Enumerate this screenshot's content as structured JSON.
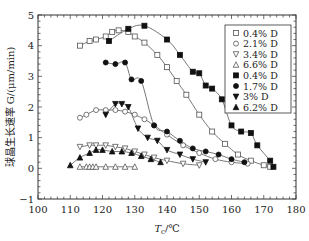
{
  "chart_data": {
    "type": "scatter",
    "title": "",
    "xlabel": "T_c/℃",
    "ylabel": "球晶生长速率 G/(μm/min)",
    "xlim": [
      100,
      180
    ],
    "ylim": [
      -1,
      5
    ],
    "xticks": [
      100,
      110,
      120,
      130,
      140,
      150,
      160,
      170,
      180
    ],
    "yticks": [
      -1,
      0,
      1,
      2,
      3,
      4,
      5
    ],
    "grid": false,
    "legend_position": "upper right",
    "series": [
      {
        "name": "0.4% D",
        "marker": "square-open",
        "x": [
          113,
          116,
          118,
          121,
          123,
          125,
          128,
          130,
          133,
          137,
          140,
          143,
          146,
          150,
          154,
          158,
          162,
          166,
          170,
          172
        ],
        "y": [
          4.0,
          4.15,
          4.2,
          4.3,
          4.45,
          4.5,
          4.45,
          4.3,
          4.1,
          3.7,
          3.3,
          2.85,
          2.4,
          1.75,
          1.2,
          0.8,
          0.45,
          0.25,
          0.1,
          0.05
        ]
      },
      {
        "name": "2.1% D",
        "marker": "circle-open",
        "x": [
          113,
          115,
          118,
          121,
          124,
          127,
          130,
          133,
          136,
          140,
          145,
          150,
          155,
          160,
          165
        ],
        "y": [
          1.65,
          1.75,
          1.9,
          1.9,
          1.9,
          1.85,
          1.75,
          1.6,
          1.4,
          1.1,
          0.75,
          0.5,
          0.3,
          0.2,
          0.15
        ]
      },
      {
        "name": "3.4% D",
        "marker": "triangle-down-open",
        "x": [
          113,
          116,
          118,
          121,
          124,
          127,
          130,
          133,
          136,
          140,
          145,
          150
        ],
        "y": [
          0.7,
          0.75,
          0.75,
          0.75,
          0.7,
          0.65,
          0.55,
          0.45,
          0.35,
          0.25,
          0.15,
          0.1
        ]
      },
      {
        "name": "6.6% D",
        "marker": "triangle-up-open",
        "x": [
          113,
          115,
          116,
          117,
          118,
          121,
          124,
          127,
          130
        ],
        "y": [
          0.05,
          0.05,
          0.05,
          0.05,
          0.05,
          0.05,
          0.05,
          0.05,
          0.05
        ]
      },
      {
        "name": "0.4% D",
        "marker": "square-filled",
        "x": [
          122,
          128,
          133,
          140,
          144,
          148,
          150,
          152,
          154,
          157,
          160,
          163,
          166,
          168,
          172,
          173
        ],
        "y": [
          4.15,
          4.55,
          4.65,
          4.2,
          3.7,
          3.15,
          3.1,
          2.7,
          2.6,
          2.25,
          1.4,
          1.2,
          1.15,
          0.75,
          0.25,
          0.05
        ]
      },
      {
        "name": "1.7% D",
        "marker": "circle-filled",
        "x": [
          121,
          124,
          127,
          129,
          132,
          136,
          140,
          144,
          148,
          152,
          156,
          160,
          164
        ],
        "y": [
          3.45,
          3.4,
          3.45,
          2.9,
          2.85,
          1.4,
          1.2,
          0.9,
          0.65,
          0.55,
          0.45,
          0.3,
          0.2
        ]
      },
      {
        "name": "3% D",
        "marker": "triangle-down-filled",
        "x": [
          121,
          124,
          126,
          128,
          131,
          134,
          137,
          140,
          144,
          148,
          152
        ],
        "y": [
          1.75,
          2.1,
          2.1,
          2.0,
          1.3,
          1.0,
          0.9,
          0.6,
          0.45,
          0.3,
          0.2
        ]
      },
      {
        "name": "6.2% D",
        "marker": "triangle-up-filled",
        "x": [
          110,
          113,
          116,
          118,
          120,
          123,
          126,
          129,
          132,
          135,
          138
        ],
        "y": [
          0.1,
          0.35,
          0.5,
          0.6,
          0.6,
          0.55,
          0.55,
          0.5,
          0.4,
          0.3,
          0.2
        ]
      }
    ]
  },
  "axes": {
    "xlabel_main": "T",
    "xlabel_sub": "c",
    "xlabel_unit": "/℃",
    "ylabel": "球晶生长速率 G/(μm/min)"
  }
}
